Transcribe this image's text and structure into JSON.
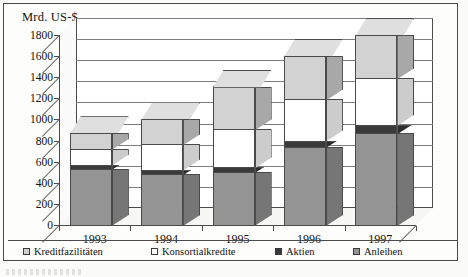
{
  "axis_title": "Mrd. US-$",
  "legend": [
    {
      "label": "Kreditfazilitäten",
      "color": "#d2d2d2"
    },
    {
      "label": "Konsortialkredite",
      "color": "#ffffff"
    },
    {
      "label": "Aktien",
      "color": "#3a3a3a"
    },
    {
      "label": "Anleihen",
      "color": "#949494"
    }
  ],
  "chart_data": {
    "type": "bar",
    "title": "Mrd. US-$",
    "subtitle": "",
    "xlabel": "",
    "ylabel": "Mrd. US-$",
    "stacked": true,
    "three_d": true,
    "grid": true,
    "legend_position": "bottom",
    "categories": [
      "1993",
      "1994",
      "1995",
      "1996",
      "1997"
    ],
    "ylim": [
      0,
      1800
    ],
    "yticks": [
      0,
      200,
      400,
      600,
      800,
      1000,
      1200,
      1400,
      1600,
      1800
    ],
    "ytick_labels": [
      "0",
      "200",
      "400",
      "600",
      "800",
      "1000",
      "1200",
      "1400",
      "1600",
      "1800"
    ],
    "series": [
      {
        "name": "Anleihen",
        "color": "#949494",
        "values": [
          530,
          480,
          500,
          740,
          870
        ]
      },
      {
        "name": "Aktien",
        "color": "#3a3a3a",
        "values": [
          40,
          45,
          45,
          60,
          80
        ]
      },
      {
        "name": "Konsortialkredite",
        "color": "#ffffff",
        "values": [
          150,
          240,
          360,
          390,
          440
        ]
      },
      {
        "name": "Kreditfazilitäten",
        "color": "#d2d2d2",
        "values": [
          150,
          235,
          405,
          410,
          410
        ]
      }
    ],
    "totals": [
      870,
      1000,
      1310,
      1600,
      1800
    ]
  }
}
